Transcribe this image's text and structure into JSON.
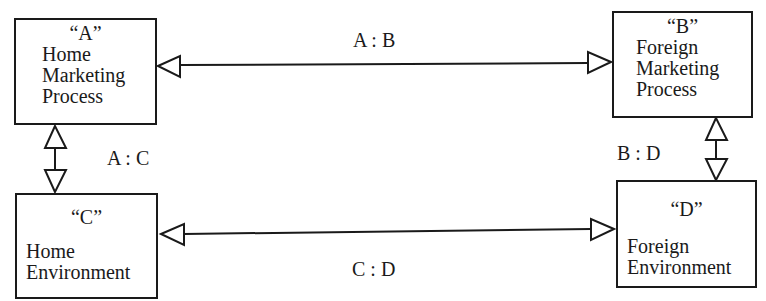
{
  "diagram": {
    "boxes": {
      "a": {
        "code": "“A”",
        "lines": [
          "Home",
          "Marketing",
          "Process"
        ]
      },
      "b": {
        "code": "“B”",
        "lines": [
          "Foreign",
          "Marketing",
          "Process"
        ]
      },
      "c": {
        "code": "“C”",
        "lines": [
          "Home",
          "Environment"
        ]
      },
      "d": {
        "code": "“D”",
        "lines": [
          "Foreign",
          "Environment"
        ]
      }
    },
    "relations": {
      "ab": "A : B",
      "ac": "A : C",
      "bd": "B : D",
      "cd": "C : D"
    },
    "colors": {
      "ink": "#1a1a1a",
      "background": "#ffffff"
    }
  }
}
